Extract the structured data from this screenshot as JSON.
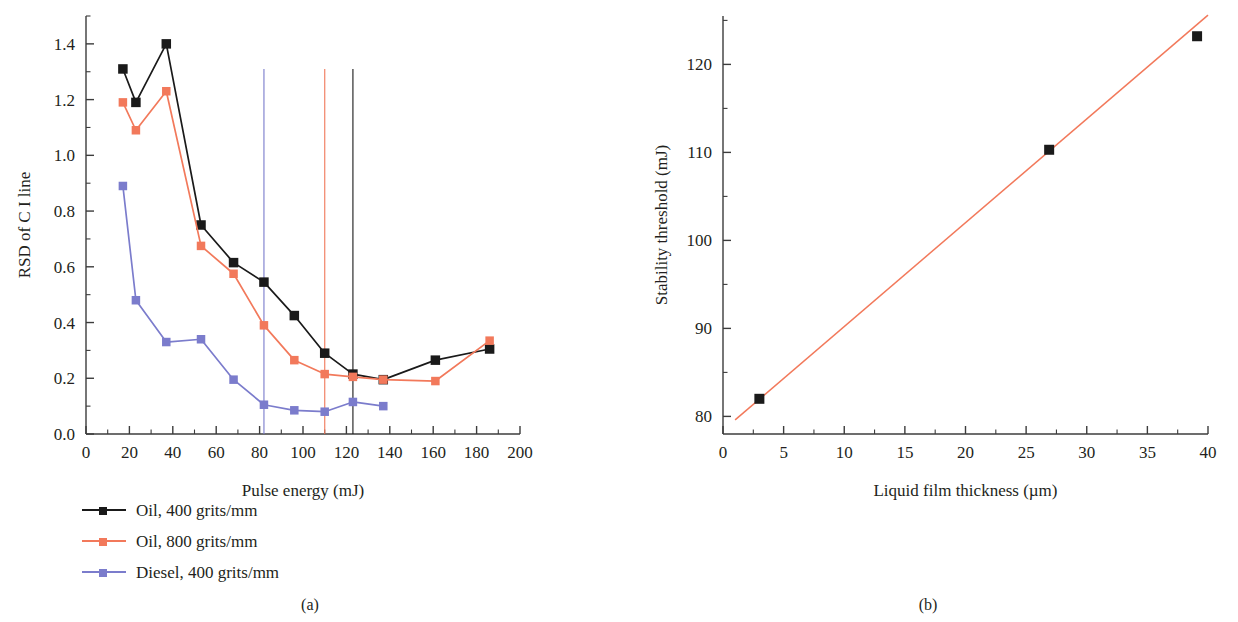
{
  "figure": {
    "panel_a_label": "(a)",
    "panel_b_label": "(b)"
  },
  "colors": {
    "black": "#1a1a1a",
    "orange": "#f2795b",
    "purple": "#7b7ccc",
    "axis": "#3c3c3c",
    "text": "#231f20"
  },
  "panel_a": {
    "xlabel": "Pulse energy (mJ)",
    "ylabel": "RSD of C I line",
    "xticks": [
      "0",
      "20",
      "40",
      "60",
      "80",
      "100",
      "120",
      "140",
      "160",
      "180",
      "200"
    ],
    "yticks": [
      "0.0",
      "0.2",
      "0.4",
      "0.6",
      "0.8",
      "1.0",
      "1.2",
      "1.4"
    ],
    "legend": [
      {
        "label": "Oil, 400 grits/mm",
        "color": "#1a1a1a",
        "marker": "square"
      },
      {
        "label": "Oil, 800 grits/mm",
        "color": "#f2795b",
        "marker": "square"
      },
      {
        "label": "Diesel, 400 grits/mm",
        "color": "#7b7ccc",
        "marker": "square"
      }
    ]
  },
  "panel_b": {
    "xlabel": "Liquid film thickness (µm)",
    "ylabel": "Stability threshold (mJ)",
    "xticks": [
      "0",
      "5",
      "10",
      "15",
      "20",
      "25",
      "30",
      "35",
      "40"
    ],
    "yticks": [
      "80",
      "90",
      "100",
      "110",
      "120"
    ]
  },
  "chart_data": [
    {
      "type": "line",
      "id": "panel-a",
      "title": "",
      "xlabel": "Pulse energy (mJ)",
      "ylabel": "RSD of C I line",
      "xlim": [
        0,
        200
      ],
      "ylim": [
        0.0,
        1.5
      ],
      "xticks": [
        0,
        20,
        40,
        60,
        80,
        100,
        120,
        140,
        160,
        180,
        200
      ],
      "yticks": [
        0.0,
        0.2,
        0.4,
        0.6,
        0.8,
        1.0,
        1.2,
        1.4
      ],
      "grid": false,
      "legend_position": "below-left",
      "marker": "square",
      "series": [
        {
          "name": "Oil, 400 grits/mm",
          "color": "#1a1a1a",
          "x": [
            17,
            23,
            37,
            53,
            68,
            82,
            96,
            110,
            123,
            137,
            161,
            186
          ],
          "y": [
            1.31,
            1.19,
            1.4,
            0.75,
            0.615,
            0.545,
            0.425,
            0.29,
            0.215,
            0.195,
            0.265,
            0.305
          ]
        },
        {
          "name": "Oil, 800 grits/mm",
          "color": "#f2795b",
          "x": [
            17,
            23,
            37,
            53,
            68,
            82,
            96,
            110,
            123,
            137,
            161,
            186
          ],
          "y": [
            1.19,
            1.09,
            1.23,
            0.675,
            0.575,
            0.39,
            0.265,
            0.215,
            0.205,
            0.195,
            0.19,
            0.335
          ]
        },
        {
          "name": "Diesel, 400 grits/mm",
          "color": "#7b7ccc",
          "x": [
            17,
            23,
            37,
            53,
            68,
            82,
            96,
            110,
            123,
            137
          ],
          "y": [
            0.89,
            0.48,
            0.33,
            0.34,
            0.195,
            0.105,
            0.085,
            0.08,
            0.115,
            0.1
          ]
        }
      ],
      "reference_lines": [
        {
          "name": "Diesel, 400 grits/mm threshold",
          "x": 82,
          "color": "#7b7ccc",
          "orientation": "vertical"
        },
        {
          "name": "Oil, 800 grits/mm threshold",
          "x": 110,
          "color": "#f2795b",
          "orientation": "vertical"
        },
        {
          "name": "Oil, 400 grits/mm threshold",
          "x": 123,
          "color": "#1a1a1a",
          "orientation": "vertical"
        }
      ]
    },
    {
      "type": "scatter",
      "id": "panel-b",
      "title": "",
      "xlabel": "Liquid film thickness (µm)",
      "ylabel": "Stability threshold (mJ)",
      "xlim": [
        0,
        40
      ],
      "ylim": [
        78,
        125.5
      ],
      "xticks": [
        0,
        5,
        10,
        15,
        20,
        25,
        30,
        35,
        40
      ],
      "yticks": [
        80,
        90,
        100,
        110,
        120
      ],
      "grid": false,
      "marker": "square",
      "series": [
        {
          "name": "Stability threshold",
          "color": "#1a1a1a",
          "x": [
            3.0,
            26.9,
            39.1
          ],
          "y": [
            82.0,
            110.3,
            123.2
          ]
        }
      ],
      "fit_line": {
        "name": "linear fit",
        "color": "#f2795b",
        "x": [
          1.0,
          40.0
        ],
        "y": [
          79.6,
          125.6
        ]
      }
    }
  ]
}
